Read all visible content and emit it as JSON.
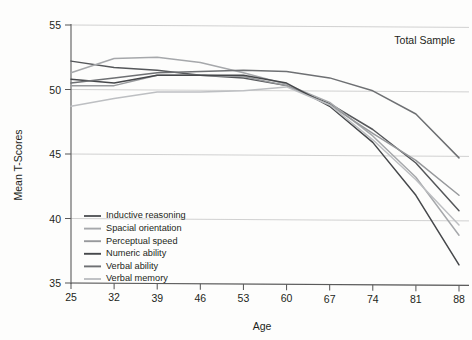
{
  "annotation": {
    "total_sample": "Total Sample"
  },
  "chart_data": {
    "type": "line",
    "title": "",
    "subtitle": "",
    "annotations": [
      "Total Sample"
    ],
    "xlabel": "Age",
    "ylabel": "Mean T-Scores",
    "x": [
      25,
      32,
      39,
      46,
      53,
      60,
      67,
      74,
      81,
      88
    ],
    "xtick_labels": [
      "25",
      "32",
      "39",
      "46",
      "53",
      "60",
      "67",
      "74",
      "81",
      "88"
    ],
    "ytick_labels": [
      "35",
      "40",
      "45",
      "50",
      "55"
    ],
    "yticks": [
      35,
      40,
      45,
      50,
      55
    ],
    "xlim": [
      25,
      88
    ],
    "ylim": [
      35,
      55
    ],
    "grid": true,
    "grid_axis": "y",
    "legend_position": "lower-left-inside",
    "series": [
      {
        "name": "Inductive reasoning",
        "color": "#55575a",
        "values": [
          52.2,
          51.7,
          51.5,
          51.1,
          50.9,
          50.3,
          48.9,
          46.9,
          44.3,
          40.6
        ]
      },
      {
        "name": "Spacial orientation",
        "color": "#a6a8ab",
        "values": [
          51.3,
          52.4,
          52.5,
          52.1,
          51.3,
          50.4,
          49.0,
          46.4,
          43.2,
          38.7
        ]
      },
      {
        "name": "Perceptual speed",
        "color": "#97999c",
        "values": [
          50.3,
          50.3,
          51.1,
          51.1,
          51.0,
          50.3,
          48.8,
          46.6,
          44.5,
          41.8
        ]
      },
      {
        "name": "Numeric ability",
        "color": "#46484b",
        "values": [
          50.8,
          50.5,
          51.1,
          51.1,
          51.1,
          50.5,
          48.7,
          45.9,
          41.8,
          36.4
        ]
      },
      {
        "name": "Verbal ability",
        "color": "#6e7073",
        "values": [
          50.5,
          50.9,
          51.3,
          51.4,
          51.5,
          51.4,
          50.9,
          49.9,
          48.1,
          44.7
        ]
      },
      {
        "name": "Verbal memory",
        "color": "#bdbfc2",
        "values": [
          48.7,
          49.3,
          49.8,
          49.8,
          49.9,
          50.2,
          48.8,
          46.1,
          43.0,
          39.5
        ]
      }
    ]
  }
}
